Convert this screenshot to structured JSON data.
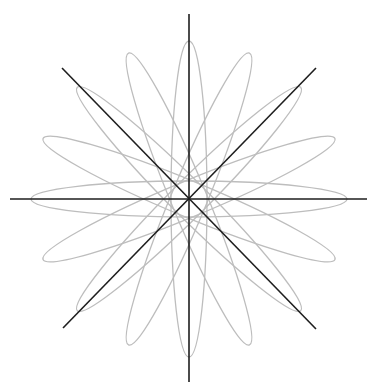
{
  "diagram": {
    "type": "rose-of-ellipses",
    "center": {
      "x": 189,
      "y": 199
    },
    "ellipses": {
      "count": 8,
      "semi_major": 158,
      "semi_minor": 18,
      "rotation_step_deg": 22.5,
      "angles_deg": [
        0,
        22.5,
        45,
        67.5,
        90,
        112.5,
        135,
        157.5
      ],
      "stroke_color": "#bdbdbd"
    },
    "lines": {
      "stroke_color": "#1e1e1e",
      "items": [
        {
          "name": "horizontal-axis",
          "x1": 10,
          "y1": 199,
          "x2": 367,
          "y2": 199
        },
        {
          "name": "vertical-axis",
          "x1": 189,
          "y1": 14,
          "x2": 189,
          "y2": 382
        },
        {
          "name": "diagonal-main",
          "x1": 62,
          "y1": 68,
          "x2": 316,
          "y2": 329
        },
        {
          "name": "diagonal-anti",
          "x1": 316,
          "y1": 68,
          "x2": 63,
          "y2": 328
        }
      ]
    }
  }
}
